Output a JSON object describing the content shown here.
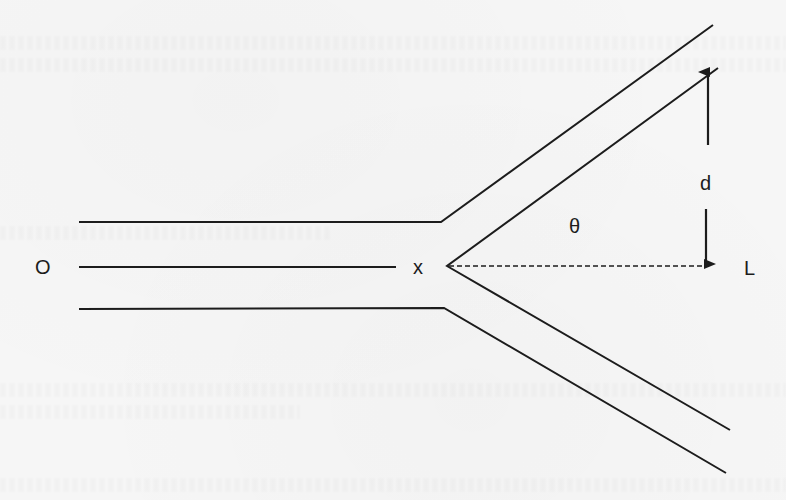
{
  "diagram": {
    "title": "",
    "colors": {
      "background": "#f6f6f6",
      "stroke": "#1c1c1c"
    },
    "labels": {
      "origin": "O",
      "junction": "x",
      "angle": "θ",
      "separation": "d",
      "end": "L"
    },
    "geometry": {
      "top_wall": [
        [
          79,
          222
        ],
        [
          441,
          222
        ],
        [
          713,
          25
        ]
      ],
      "center_line": [
        [
          79,
          267
        ],
        [
          396,
          267
        ]
      ],
      "bottom_wall": [
        [
          79,
          309
        ],
        [
          444,
          308
        ],
        [
          726,
          473
        ]
      ],
      "inner_upper_branch": [
        [
          447,
          266
        ],
        [
          718,
          68
        ]
      ],
      "inner_lower_branch": [
        [
          447,
          266
        ],
        [
          730,
          430
        ]
      ],
      "dashed_axis": [
        [
          447,
          266
        ],
        [
          705,
          266
        ]
      ],
      "arrow_up": [
        [
          708,
          145
        ],
        [
          708,
          70
        ]
      ],
      "arrow_down": [
        [
          706,
          209
        ],
        [
          706,
          266
        ]
      ]
    }
  }
}
